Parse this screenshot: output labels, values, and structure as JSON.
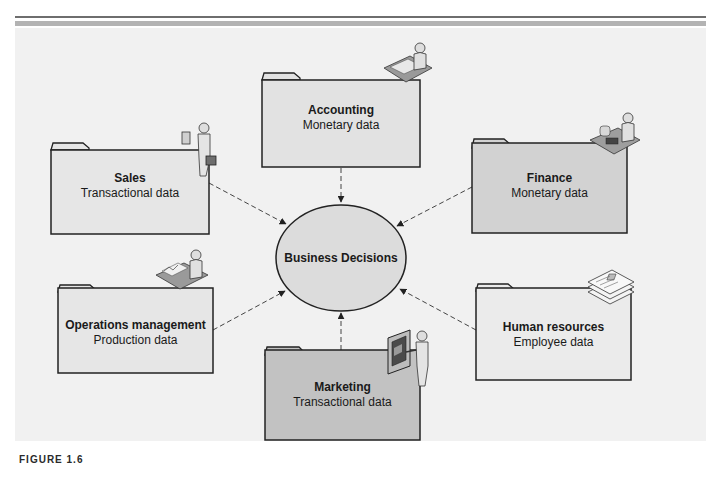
{
  "figure": {
    "caption": "FIGURE 1.6",
    "colors": {
      "panel_bg": "#f1f1f1",
      "folder_light": "#e6e6e6",
      "folder_mid": "#d6d6d6",
      "folder_dark": "#c2c2c2",
      "ellipse_fill": "#dcdcdc",
      "stroke": "#222222",
      "rule_dark": "#6e6e6e",
      "rule_band": "#b3b3b3"
    }
  },
  "center": {
    "label": "Business Decisions"
  },
  "departments": [
    {
      "id": "accounting",
      "title": "Accounting",
      "subtitle": "Monetary data",
      "icon": "person-at-desk-icon"
    },
    {
      "id": "sales",
      "title": "Sales",
      "subtitle": "Transactional data",
      "icon": "person-with-briefcase-icon"
    },
    {
      "id": "finance",
      "title": "Finance",
      "subtitle": "Monetary data",
      "icon": "person-with-calculator-icon"
    },
    {
      "id": "operations",
      "title": "Operations management",
      "subtitle": "Production data",
      "icon": "person-at-desk-chart-icon"
    },
    {
      "id": "marketing",
      "title": "Marketing",
      "subtitle": "Transactional data",
      "icon": "person-presenting-board-icon"
    },
    {
      "id": "hr",
      "title": "Human resources",
      "subtitle": "Employee data",
      "icon": "employee-documents-icon"
    }
  ],
  "connections": [
    {
      "from": "accounting",
      "to": "center",
      "style": "dashed-arrow"
    },
    {
      "from": "sales",
      "to": "center",
      "style": "dashed-arrow"
    },
    {
      "from": "finance",
      "to": "center",
      "style": "dashed-arrow"
    },
    {
      "from": "operations",
      "to": "center",
      "style": "dashed-arrow"
    },
    {
      "from": "marketing",
      "to": "center",
      "style": "dashed-arrow"
    },
    {
      "from": "hr",
      "to": "center",
      "style": "dashed-arrow"
    }
  ]
}
